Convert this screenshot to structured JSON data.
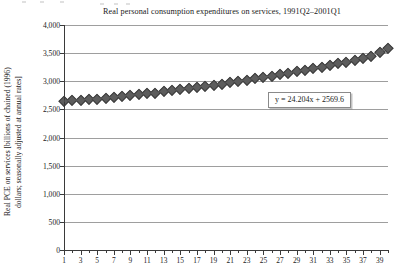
{
  "figure": {
    "title": "Real personal consumption expenditures on services, 1991Q2–2001Q1",
    "axis_color": "#3a3a3a",
    "gridline_color": "#9e9e9e",
    "marker_color": "#5d5d5d",
    "background": "#ffffff"
  },
  "yaxis": {
    "label_line1": "Real PCE on services [billions of chained (1996)",
    "label_line2": "dollars; seasonally adjusted at annual rates]",
    "ticks": [
      "4,000",
      "3,500",
      "3,000",
      "2,500",
      "2,000",
      "1,500",
      "1,000",
      "500",
      "0"
    ],
    "min": 0,
    "max": 4000,
    "step": 500
  },
  "xaxis": {
    "label": "",
    "ticks": [
      "1",
      "3",
      "5",
      "7",
      "9",
      "11",
      "13",
      "15",
      "17",
      "19",
      "21",
      "23",
      "25",
      "27",
      "29",
      "31",
      "33",
      "35",
      "37",
      "39"
    ],
    "min": 1,
    "max": 40
  },
  "annotation": {
    "equation": "y = 24.204x + 2569.6",
    "slope": 24.204,
    "intercept": 2569.6
  },
  "chart_data": {
    "type": "line",
    "title": "Real personal consumption expenditures on services, 1991Q2–2001Q1",
    "xlabel": "",
    "ylabel": "Real PCE on services [billions of chained (1996) dollars; seasonally adjusted at annual rates]",
    "xlim": [
      1,
      40
    ],
    "ylim": [
      0,
      4000
    ],
    "grid": true,
    "legend": false,
    "marker": "diamond",
    "annotations": [
      "y = 24.204x + 2569.6"
    ],
    "x": [
      1,
      2,
      3,
      4,
      5,
      6,
      7,
      8,
      9,
      10,
      11,
      12,
      13,
      14,
      15,
      16,
      17,
      18,
      19,
      20,
      21,
      22,
      23,
      24,
      25,
      26,
      27,
      28,
      29,
      30,
      31,
      32,
      33,
      34,
      35,
      36,
      37,
      38,
      39,
      40
    ],
    "xtick_labels": [
      "1",
      "3",
      "5",
      "7",
      "9",
      "11",
      "13",
      "15",
      "17",
      "19",
      "21",
      "23",
      "25",
      "27",
      "29",
      "31",
      "33",
      "35",
      "37",
      "39"
    ],
    "ytick_labels": [
      "0",
      "500",
      "1,000",
      "1,500",
      "2,000",
      "2,500",
      "3,000",
      "3,500",
      "4,000"
    ],
    "series": [
      {
        "name": "Real PCE on services",
        "values": [
          2648,
          2659,
          2672,
          2682,
          2693,
          2707,
          2722,
          2737,
          2752,
          2766,
          2783,
          2800,
          2818,
          2836,
          2855,
          2875,
          2896,
          2917,
          2938,
          2960,
          2982,
          3004,
          3027,
          3050,
          3074,
          3098,
          3123,
          3148,
          3174,
          3201,
          3229,
          3258,
          3288,
          3319,
          3351,
          3384,
          3418,
          3453,
          3520,
          3590
        ]
      }
    ]
  }
}
